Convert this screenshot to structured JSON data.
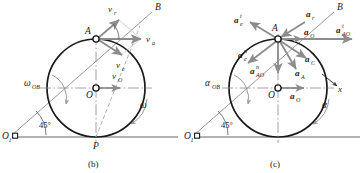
{
  "figure": {
    "panels": [
      {
        "id": "panel-b",
        "caption": "(b)",
        "kind": "velocity-diagram",
        "points": [
          {
            "name": "O1",
            "label": "O",
            "sublabel": "1",
            "x": 12,
            "y": 131
          },
          {
            "name": "O",
            "label": "O",
            "sublabel": "",
            "x": 96,
            "y": 88
          },
          {
            "name": "A",
            "label": "A",
            "sublabel": "",
            "x": 96,
            "y": 39
          },
          {
            "name": "P",
            "label": "P",
            "sublabel": "",
            "x": 96,
            "y": 137
          },
          {
            "name": "B",
            "label": "B",
            "sublabel": "",
            "x": 152,
            "y": 8
          }
        ],
        "angle_label": "45°",
        "omega_rod_label": "ω",
        "omega_rod_sub": "OB",
        "omega_wheel_label": "ω",
        "vectors": [
          {
            "name": "v-r",
            "label": "v",
            "sup": "",
            "sub": "r",
            "desc": "relative velocity along OB"
          },
          {
            "name": "v-a",
            "label": "v",
            "sup": "",
            "sub": "a",
            "desc": "absolute velocity of A, horizontal right"
          },
          {
            "name": "v-e",
            "label": "v",
            "sup": "",
            "sub": "e",
            "desc": "entrainment velocity, down-right"
          },
          {
            "name": "v-O",
            "label": "v",
            "sup": "",
            "sub": "O",
            "desc": "velocity of wheel centre O, horizontal right"
          }
        ]
      },
      {
        "id": "panel-c",
        "caption": "(c)",
        "kind": "acceleration-diagram",
        "points": [
          {
            "name": "O1",
            "label": "O",
            "sublabel": "1",
            "x": 194,
            "y": 131
          },
          {
            "name": "O",
            "label": "O",
            "sublabel": "",
            "x": 278,
            "y": 88
          },
          {
            "name": "A",
            "label": "A",
            "sublabel": "",
            "x": 278,
            "y": 39
          },
          {
            "name": "B",
            "label": "B",
            "sublabel": "",
            "x": 334,
            "y": 8
          }
        ],
        "angle_label": "45°",
        "alpha_rod_label": "α",
        "alpha_rod_sub": "OB",
        "alpha_wheel_label": "α",
        "axis_label": "x",
        "vectors": [
          {
            "name": "a-e-t",
            "label": "a",
            "sup": "t",
            "sub": "e",
            "desc": "tangential entrainment acceleration, up-left"
          },
          {
            "name": "a-r",
            "label": "a",
            "sup": "",
            "sub": "r",
            "desc": "relative acceleration along BO toward A"
          },
          {
            "name": "a-O-top",
            "label": "a",
            "sup": "",
            "sub": "O",
            "desc": "acceleration of O drawn at A, horizontal right"
          },
          {
            "name": "a-AO-t",
            "label": "a",
            "sup": "t",
            "sub": "AO",
            "desc": "tangential acceleration of A about O, horizontal right"
          },
          {
            "name": "a-e-n",
            "label": "a",
            "sup": "n",
            "sub": "e",
            "desc": "normal entrainment acceleration, down-left"
          },
          {
            "name": "a-AO-n",
            "label": "a",
            "sup": "n",
            "sub": "AO",
            "desc": "normal acceleration of A about O, straight down"
          },
          {
            "name": "a-C",
            "label": "a",
            "sup": "",
            "sub": "C",
            "desc": "Coriolis acceleration, down-right"
          },
          {
            "name": "a-A",
            "label": "a",
            "sup": "",
            "sub": "A",
            "desc": "absolute acceleration of A, down-right steep"
          },
          {
            "name": "a-O-mid",
            "label": "a",
            "sup": "",
            "sub": "O",
            "desc": "acceleration of centre O, horizontal right"
          }
        ]
      }
    ],
    "colors": {
      "vector": "#8c8c8c",
      "outline": "#1a1a1a",
      "construction": "#9a9a9a",
      "text": "#1a1a1a"
    }
  }
}
